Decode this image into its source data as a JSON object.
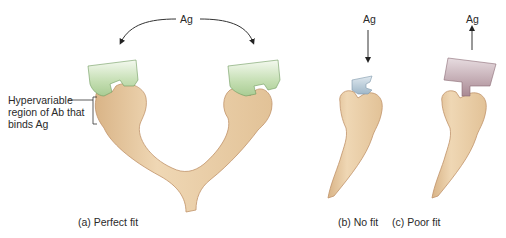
{
  "figure": {
    "top_label": "Ag",
    "annotation": {
      "lines": [
        "Hypervariable",
        "region of Ab that",
        "binds Ag"
      ]
    },
    "panels": [
      {
        "id": "a",
        "caption": "(a) Perfect fit",
        "antigen_label": "Ag",
        "arrow": "curved-down-both"
      },
      {
        "id": "b",
        "caption": "(b) No fit",
        "antigen_label": "Ag",
        "arrow": "down"
      },
      {
        "id": "c",
        "caption": "(c) Poor fit",
        "antigen_label": "Ag",
        "arrow": "up"
      }
    ],
    "colors": {
      "antibody": "#e8c9a0",
      "antibody_edge": "#b98a5c",
      "antigen_perfect": "#b9d7a6",
      "antigen_nofit": "#b9cbd8",
      "antigen_poorfit": "#b4969f"
    }
  }
}
